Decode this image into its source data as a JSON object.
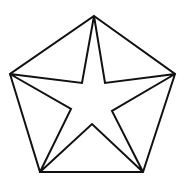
{
  "diagram": {
    "stroke_color": "#111111",
    "background": "#ffffff",
    "stroke_width": 2,
    "outer_pentagon": [
      [
        94,
        16
      ],
      [
        175,
        74
      ],
      [
        143,
        172
      ],
      [
        40,
        172
      ],
      [
        10,
        74
      ]
    ],
    "inner_star": [
      [
        94,
        16
      ],
      [
        105,
        83
      ],
      [
        175,
        74
      ],
      [
        112,
        111
      ],
      [
        143,
        172
      ],
      [
        92,
        124
      ],
      [
        40,
        172
      ],
      [
        71,
        109
      ],
      [
        10,
        74
      ],
      [
        82,
        83
      ]
    ]
  }
}
